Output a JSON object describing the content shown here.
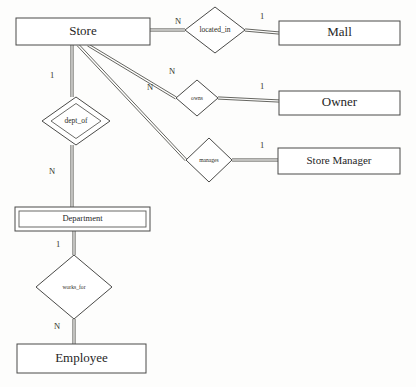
{
  "diagram": {
    "type": "er-diagram",
    "background_color": "#fdfdfc",
    "line_color": "#55554f",
    "text_color": "#26261f"
  },
  "entities": [
    {
      "id": "store",
      "label": "Store",
      "kind": "strong",
      "box": {
        "x": 16,
        "y": 18,
        "w": 134,
        "h": 27
      },
      "font": "big"
    },
    {
      "id": "mall",
      "label": "Mall",
      "kind": "strong",
      "box": {
        "x": 279,
        "y": 21,
        "w": 121,
        "h": 24
      },
      "font": "big"
    },
    {
      "id": "owner",
      "label": "Owner",
      "kind": "strong",
      "box": {
        "x": 279,
        "y": 91,
        "w": 121,
        "h": 24
      },
      "font": "big"
    },
    {
      "id": "store_manager",
      "label": "Store Manager",
      "kind": "strong",
      "box": {
        "x": 278,
        "y": 148,
        "w": 122,
        "h": 26
      },
      "font": "mid"
    },
    {
      "id": "department",
      "label": "Department",
      "kind": "weak",
      "box": {
        "x": 15,
        "y": 207,
        "w": 135,
        "h": 24
      },
      "font": "small"
    },
    {
      "id": "employee",
      "label": "Employee",
      "kind": "strong",
      "box": {
        "x": 17,
        "y": 344,
        "w": 129,
        "h": 29
      },
      "font": "big"
    }
  ],
  "relationships": [
    {
      "id": "located_in",
      "label": "located_in",
      "kind": "regular",
      "cx": 215,
      "cy": 30,
      "rx": 30,
      "ry": 23,
      "font": "r-lg"
    },
    {
      "id": "owns",
      "label": "owns",
      "kind": "regular",
      "cx": 197,
      "cy": 98,
      "rx": 21,
      "ry": 18,
      "font": "r-sm"
    },
    {
      "id": "manages",
      "label": "manages",
      "kind": "regular",
      "cx": 209,
      "cy": 160,
      "rx": 23,
      "ry": 22,
      "font": "r-sm"
    },
    {
      "id": "dept_of",
      "label": "dept_of",
      "kind": "identifying",
      "cx": 76,
      "cy": 121,
      "rx": 34,
      "ry": 24,
      "font": "r-lg"
    },
    {
      "id": "works_for",
      "label": "works_for",
      "kind": "regular",
      "cx": 74,
      "cy": 287,
      "rx": 38,
      "ry": 32,
      "font": "r-sm"
    }
  ],
  "cardinalities": [
    {
      "id": "store-located_in",
      "text": "N",
      "x": 178,
      "y": 22
    },
    {
      "id": "located_in-mall",
      "text": "1",
      "x": 262,
      "y": 17
    },
    {
      "id": "store-owns",
      "text": "N",
      "x": 172,
      "y": 72
    },
    {
      "id": "owns-owner",
      "text": "1",
      "x": 262,
      "y": 87
    },
    {
      "id": "store-manages",
      "text": "N",
      "x": 150,
      "y": 88
    },
    {
      "id": "manages-store_manager",
      "text": "1",
      "x": 262,
      "y": 146
    },
    {
      "id": "store-dept_of",
      "text": "1",
      "x": 52,
      "y": 76
    },
    {
      "id": "dept_of-department",
      "text": "N",
      "x": 52,
      "y": 172
    },
    {
      "id": "department-works_for",
      "text": "1",
      "x": 58,
      "y": 245
    },
    {
      "id": "works_for-employee",
      "text": "N",
      "x": 57,
      "y": 327
    }
  ],
  "connectors": [
    {
      "id": "store-to-located_in",
      "from": "store",
      "to": "located_in",
      "style": "double",
      "path": [
        [
          150,
          30
        ],
        [
          185,
          30
        ]
      ]
    },
    {
      "id": "located_in-to-mall",
      "from": "located_in",
      "to": "mall",
      "style": "double",
      "path": [
        [
          245,
          30
        ],
        [
          279,
          33
        ]
      ]
    },
    {
      "id": "store-to-owns",
      "from": "store",
      "to": "owns",
      "style": "double",
      "path": [
        [
          88,
          45
        ],
        [
          176,
          98
        ]
      ]
    },
    {
      "id": "owns-to-owner",
      "from": "owns",
      "to": "owner",
      "style": "double",
      "path": [
        [
          218,
          98
        ],
        [
          279,
          101
        ]
      ]
    },
    {
      "id": "store-to-manages",
      "from": "store",
      "to": "manages",
      "style": "double",
      "path": [
        [
          78,
          45
        ],
        [
          186,
          160
        ]
      ]
    },
    {
      "id": "manages-to-store_manager",
      "from": "manages",
      "to": "store_manager",
      "style": "double",
      "path": [
        [
          232,
          160
        ],
        [
          278,
          160
        ]
      ]
    },
    {
      "id": "store-to-dept_of",
      "from": "store",
      "to": "dept_of",
      "style": "double",
      "path": [
        [
          72,
          45
        ],
        [
          72,
          97
        ]
      ]
    },
    {
      "id": "dept_of-to-department",
      "from": "dept_of",
      "to": "department",
      "style": "double",
      "path": [
        [
          72,
          145
        ],
        [
          72,
          207
        ]
      ]
    },
    {
      "id": "department-to-works_for",
      "from": "department",
      "to": "works_for",
      "style": "double",
      "path": [
        [
          74,
          231
        ],
        [
          74,
          255
        ]
      ]
    },
    {
      "id": "works_for-to-employee",
      "from": "works_for",
      "to": "employee",
      "style": "double",
      "path": [
        [
          74,
          319
        ],
        [
          74,
          344
        ]
      ]
    }
  ]
}
